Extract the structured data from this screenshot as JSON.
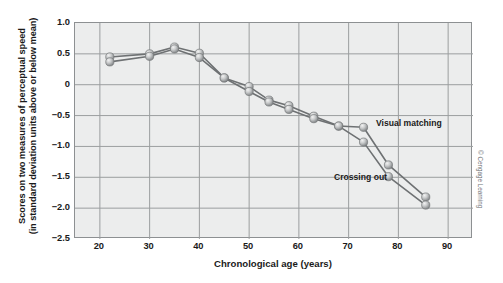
{
  "figure": {
    "credit": "© Cengage Learning"
  },
  "chart_data": {
    "type": "line",
    "title": "",
    "xlabel": "Chronological age (years)",
    "ylabel": "Scores on two measures of perceptual speed (in standard deviation units above or below mean)",
    "ylabel_line1": "Scores on two measures of perceptual speed",
    "ylabel_line2": "(in standard deviation units above or below mean)",
    "xlim": [
      15,
      95
    ],
    "ylim": [
      -2.5,
      1.0
    ],
    "xticks": [
      20,
      30,
      40,
      50,
      60,
      70,
      80,
      90
    ],
    "xtick_labels": [
      "20",
      "30",
      "40",
      "50",
      "60",
      "70",
      "80",
      "90"
    ],
    "yticks": [
      1.0,
      0.5,
      0,
      -0.5,
      -1.0,
      -1.5,
      -2.0,
      -2.5
    ],
    "ytick_labels": [
      "1.0",
      "0.5",
      "0",
      "−0.5",
      "−1.0",
      "−1.5",
      "−2.0",
      "−2.5"
    ],
    "grid": true,
    "legend_position": "inline-annotation",
    "marker": "sphere",
    "series": [
      {
        "name": "Visual matching",
        "annotation": "Visual matching",
        "color": "#9a9c9e",
        "x": [
          22,
          30,
          35,
          40,
          45,
          50,
          54,
          58,
          63,
          68,
          73,
          78,
          85.5
        ],
        "y": [
          0.45,
          0.5,
          0.61,
          0.51,
          0.11,
          -0.03,
          -0.25,
          -0.34,
          -0.51,
          -0.67,
          -0.69,
          -1.3,
          -1.82
        ]
      },
      {
        "name": "Crossing out",
        "annotation": "Crossing out",
        "color": "#9a9c9e",
        "x": [
          22,
          30,
          35,
          40,
          45,
          50,
          54,
          58,
          63,
          68,
          73,
          78,
          85.5
        ],
        "y": [
          0.37,
          0.46,
          0.58,
          0.44,
          0.11,
          -0.11,
          -0.28,
          -0.4,
          -0.55,
          -0.67,
          -0.93,
          -1.49,
          -1.95
        ]
      }
    ]
  }
}
